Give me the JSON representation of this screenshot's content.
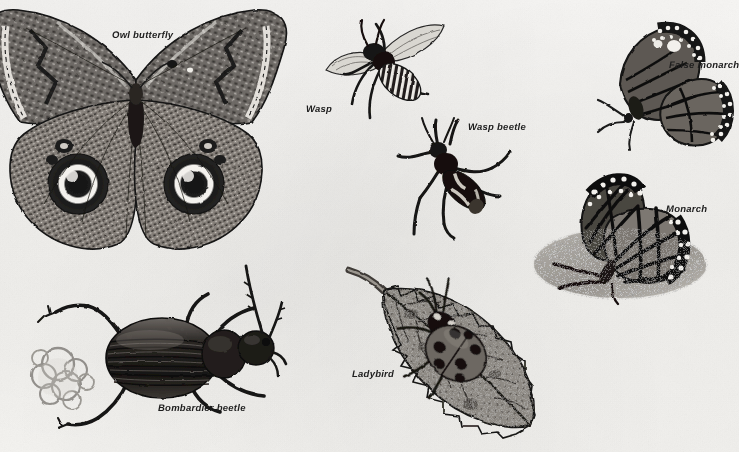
{
  "plate": {
    "title": "Insect defence and mimicry plate",
    "background_color": "#f6f5f2",
    "ink_color": "#1a1a1a",
    "width": 739,
    "height": 452,
    "style": "halftone line-and-wash natural history illustration"
  },
  "figures": [
    {
      "id": "owl-butterfly",
      "label": "Owl butterfly",
      "label_x": 112,
      "label_y": 30,
      "x": -14,
      "y": 10,
      "w": 300,
      "h": 250,
      "note": "Large spread-winged butterfly with two dark eyespots on hindwings"
    },
    {
      "id": "wasp",
      "label": "Wasp",
      "label_x": 306,
      "label_y": 104,
      "x": 318,
      "y": 14,
      "w": 130,
      "h": 110,
      "note": "Striped flying wasp, wings spread"
    },
    {
      "id": "wasp-beetle",
      "label": "Wasp beetle",
      "label_x": 468,
      "label_y": 122,
      "x": 392,
      "y": 118,
      "w": 120,
      "h": 120,
      "note": "Longhorn beetle mimicking a wasp"
    },
    {
      "id": "false-monarch",
      "label": "False monarch",
      "label_x": 669,
      "label_y": 60,
      "x": 596,
      "y": 22,
      "w": 140,
      "h": 130,
      "note": "Butterfly at rest with wings closed, white-spotted margin"
    },
    {
      "id": "monarch",
      "label": "Monarch",
      "label_x": 666,
      "label_y": 204,
      "x": 528,
      "y": 172,
      "w": 180,
      "h": 135,
      "note": "Monarch butterfly settled on speckled ground wash"
    },
    {
      "id": "bombardier-beetle",
      "label": "Bombardier beetle",
      "label_x": 158,
      "label_y": 403,
      "x": 24,
      "y": 258,
      "w": 270,
      "h": 170,
      "note": "Ground beetle discharging a puff of defensive spray"
    },
    {
      "id": "ladybird",
      "label": "Ladybird",
      "label_x": 352,
      "label_y": 369,
      "x": 345,
      "y": 258,
      "w": 205,
      "h": 190,
      "note": "Seven-spot ladybird resting on a toothed leaf"
    }
  ]
}
